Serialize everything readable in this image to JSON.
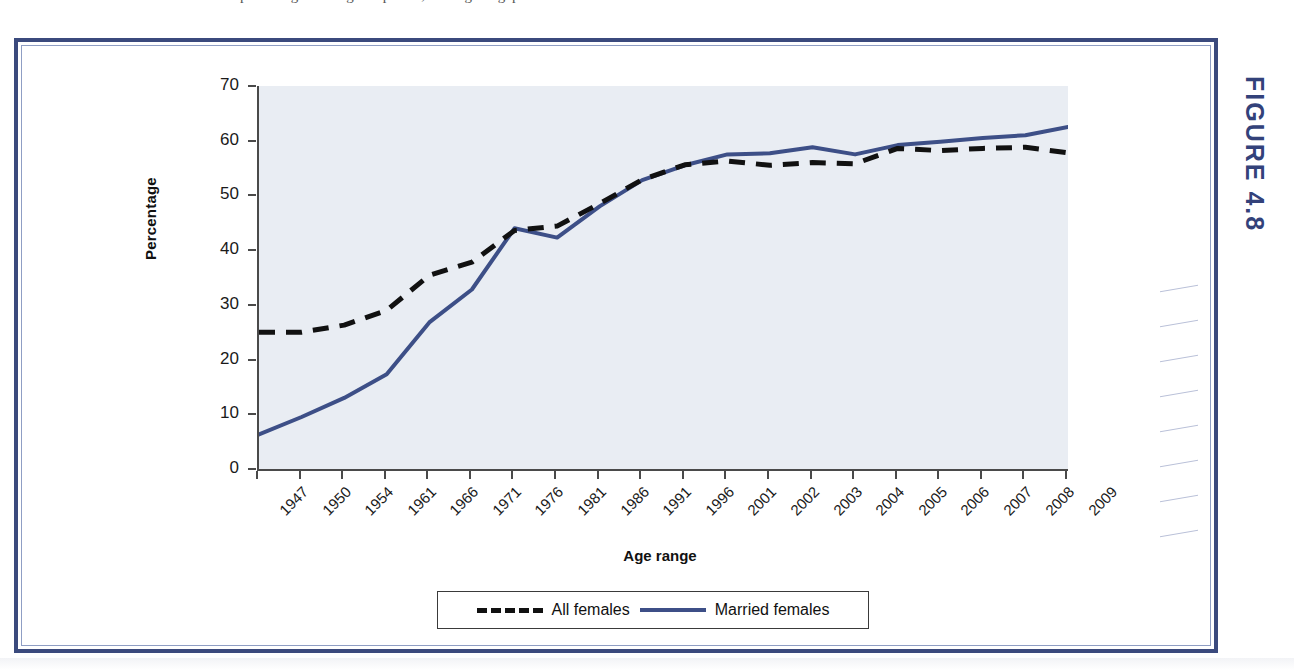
{
  "figure": {
    "tag": "FIGURE 4.8",
    "tag_color": "#33427a",
    "frame_color": "#3b4a7d"
  },
  "top_sliver": {
    "ghost_text": "percentages during this period, closing the gap between men and women."
  },
  "legend": {
    "entries": [
      {
        "label": "All females",
        "style": "dashed",
        "color": "#111111"
      },
      {
        "label": "Married females",
        "style": "solid",
        "color": "#3d4f87"
      }
    ]
  },
  "chart_data": {
    "type": "line",
    "title": "",
    "xlabel": "Age range",
    "ylabel": "Percentage",
    "ylim": [
      0,
      70
    ],
    "ytick_step": 10,
    "yticks": [
      0,
      10,
      20,
      30,
      40,
      50,
      60,
      70
    ],
    "grid": false,
    "legend_position": "bottom",
    "plot_background": "#e9edf3",
    "categories": [
      "1947",
      "1950",
      "1954",
      "1961",
      "1966",
      "1971",
      "1976",
      "1981",
      "1986",
      "1991",
      "1996",
      "2001",
      "2002",
      "2003",
      "2004",
      "2005",
      "2006",
      "2007",
      "2008",
      "2009"
    ],
    "series": [
      {
        "name": "All females",
        "style": "dashed",
        "color": "#111111",
        "values": [
          25.0,
          25.0,
          26.3,
          29.0,
          35.4,
          37.8,
          43.6,
          44.4,
          48.5,
          52.9,
          55.6,
          56.3,
          55.5,
          56.0,
          55.8,
          58.6,
          58.2,
          58.6,
          58.8,
          57.8
        ]
      },
      {
        "name": "Married females",
        "style": "solid",
        "color": "#3d4f87",
        "values": [
          6.3,
          9.5,
          13.0,
          17.3,
          26.8,
          32.8,
          44.0,
          42.3,
          48.0,
          52.8,
          55.5,
          57.5,
          57.7,
          58.8,
          57.5,
          59.2,
          59.8,
          60.5,
          61.0,
          62.5
        ]
      }
    ]
  }
}
